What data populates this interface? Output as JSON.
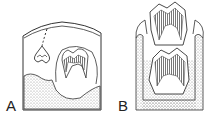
{
  "figure": {
    "panels": [
      {
        "id": "A",
        "label": "A"
      },
      {
        "id": "B",
        "label": "B"
      }
    ],
    "colors": {
      "line": "#333333",
      "stipple": "#888888",
      "hatch": "#555555",
      "background": "#ffffff"
    }
  }
}
